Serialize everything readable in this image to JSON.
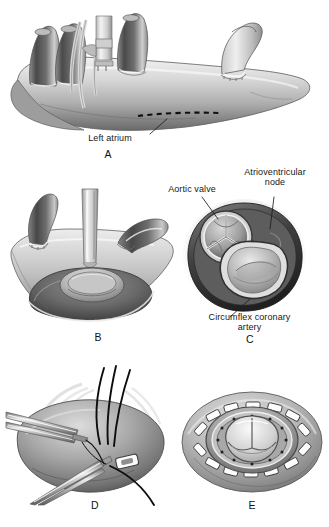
{
  "figure": {
    "type": "medical-illustration",
    "palette": {
      "background": "#ffffff",
      "ink": "#171717",
      "tissue_light": "#e8e8e8",
      "tissue_mid": "#b4b4b4",
      "tissue_dark": "#6e6e6e",
      "tissue_shadow": "#3d3d3d",
      "vessel_dark": "#555555",
      "instrument": "#9a9a9a",
      "suture": "#0d0d0d"
    }
  },
  "panels": [
    {
      "letter": "A",
      "name": "panel-a-left-atrium-exposure",
      "caption": "Left atrium exposed with dashed incision line",
      "labels": [
        {
          "text": "Left atrium",
          "name": "label-left-atrium"
        }
      ],
      "features": [
        "pulmonary vein stumps",
        "aortic cannula",
        "caval tapes",
        "dashed atriotomy line"
      ]
    },
    {
      "letter": "B",
      "name": "panel-b-atriotomy-retraction",
      "caption": "Atriotomy opened with retractor exposing mitral valve",
      "labels": [],
      "features": [
        "retractor blade",
        "vein stumps",
        "mitral valve orifice"
      ]
    },
    {
      "letter": "C",
      "name": "panel-c-annulus-cross-section",
      "caption": "Cross-section of valve annulus relationships",
      "labels": [
        {
          "text": "Aortic valve",
          "name": "label-aortic-valve"
        },
        {
          "text": "Atrioventricular",
          "text2": "node",
          "name": "label-av-node"
        },
        {
          "text": "Circumflex coronary",
          "text2": "artery",
          "name": "label-circumflex-artery"
        }
      ],
      "features": [
        "trileaflet aortic valve",
        "mitral annulus",
        "AV node",
        "circumflex artery"
      ]
    },
    {
      "letter": "D",
      "name": "panel-d-suture-placement",
      "caption": "Pledgeted sutures placed in annulus with forceps and needle driver",
      "labels": [],
      "features": [
        "forceps",
        "needle driver",
        "black sutures",
        "pledget"
      ]
    },
    {
      "letter": "E",
      "name": "panel-e-prosthesis-seated",
      "caption": "Prosthetic valve seated with circumferential pledgets",
      "labels": [],
      "features": [
        "sewing ring",
        "pledget ring",
        "trileaflet bioprosthesis"
      ]
    }
  ]
}
